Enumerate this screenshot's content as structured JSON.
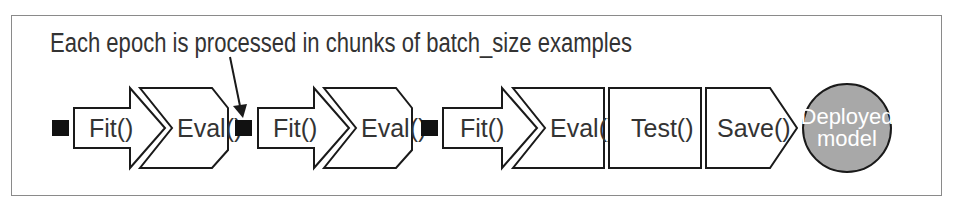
{
  "annotation": "Each epoch is processed in chunks of batch_size examples",
  "steps": [
    {
      "label": "Fit()"
    },
    {
      "label": "Eval()"
    },
    {
      "label": "Fit()"
    },
    {
      "label": "Eval()"
    },
    {
      "label": "Fit()"
    },
    {
      "label": "Eval()"
    },
    {
      "label": "Test()"
    },
    {
      "label": "Save()"
    }
  ],
  "end_node": {
    "line1": "Deployed",
    "line2": "model"
  },
  "colors": {
    "stroke": "#1a1a1a",
    "batch_marker": "#111111",
    "end_node_fill": "#a8a8a8",
    "frame": "#888888"
  }
}
